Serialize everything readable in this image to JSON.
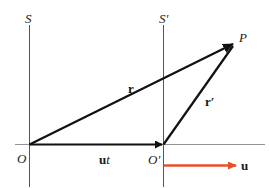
{
  "diagram": {
    "colors": {
      "axis": "#555555",
      "vector": "#111111",
      "velocity": "#e8502a"
    },
    "frames": [
      {
        "name": "S",
        "origin_label": "O"
      },
      {
        "name": "S′",
        "origin_label": "O′"
      }
    ],
    "point_label": "P",
    "vectors": [
      {
        "label": "r",
        "from": "O",
        "to": "P"
      },
      {
        "label": "r′",
        "from": "O′",
        "to": "P"
      },
      {
        "label": "ut",
        "from": "O",
        "to": "O′"
      },
      {
        "label": "u",
        "description": "velocity of frame S′ relative to S"
      }
    ],
    "labels": {
      "S": "S",
      "S_prime": "S′",
      "P": "P",
      "r": "r",
      "r_prime": "r′",
      "O": "O",
      "O_prime": "O′",
      "ut_u": "u",
      "ut_t": "t",
      "u": "u"
    }
  }
}
